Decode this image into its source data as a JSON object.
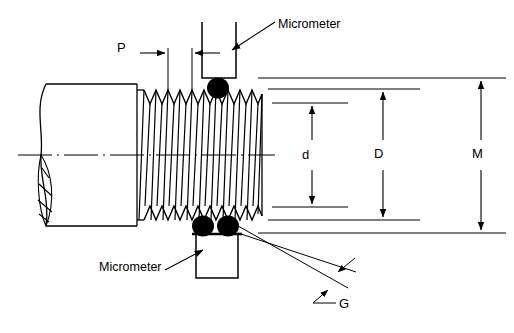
{
  "diagram": {
    "type": "engineering-drawing",
    "line_color": "#000000",
    "background_color": "#ffffff",
    "annotations": {
      "pitch": {
        "label": "P",
        "meaning": "thread pitch",
        "x": 122,
        "y": 48
      },
      "minor_diameter": {
        "label": "d",
        "meaning": "minor diameter",
        "x": 306,
        "y": 154
      },
      "major_diameter": {
        "label": "D",
        "meaning": "major diameter",
        "x": 378,
        "y": 154
      },
      "measurement_over_wires": {
        "label": "M",
        "meaning": "measurement over wires",
        "x": 477,
        "y": 154
      },
      "wire_diameter": {
        "label": "G",
        "meaning": "wire diameter",
        "x": 343,
        "y": 310
      }
    },
    "callouts": [
      {
        "label": "Micrometer",
        "meaning": "upper micrometer anvil",
        "x": 278,
        "y": 25
      },
      {
        "label": "Micrometer",
        "meaning": "lower micrometer anvil",
        "x": 101,
        "y": 268
      }
    ]
  }
}
